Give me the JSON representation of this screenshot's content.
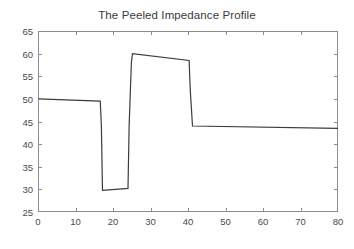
{
  "chart_data": {
    "type": "line",
    "title": "The Peeled Impedance Profile",
    "xlabel": "",
    "ylabel": "",
    "xlim": [
      0,
      80
    ],
    "ylim": [
      25,
      65
    ],
    "xticks": [
      0,
      10,
      20,
      30,
      40,
      50,
      60,
      70,
      80
    ],
    "yticks": [
      25,
      30,
      35,
      40,
      45,
      50,
      55,
      60,
      65
    ],
    "grid": false,
    "legend": null,
    "line_color": "#3c3c3c",
    "line_width": 1.2,
    "series": [
      {
        "name": "impedance",
        "x": [
          0,
          16.6,
          16.9,
          17.2,
          24.0,
          24.3,
          24.9,
          25.2,
          40.3,
          40.6,
          41.2,
          80
        ],
        "y": [
          50.0,
          49.5,
          44.0,
          29.8,
          30.2,
          44.0,
          58.0,
          60.0,
          58.5,
          52.0,
          44.0,
          43.5
        ]
      }
    ],
    "segments": [
      {
        "label": "first-plateau",
        "x_start": 0,
        "x_end": 16.6,
        "y_start": 50.0,
        "y_end": 49.5
      },
      {
        "label": "trough",
        "x_start": 17.2,
        "x_end": 24.0,
        "y_start": 29.8,
        "y_end": 30.2
      },
      {
        "label": "peak-plateau",
        "x_start": 25.2,
        "x_end": 40.3,
        "y_start": 60.0,
        "y_end": 58.5
      },
      {
        "label": "final-plateau",
        "x_start": 41.2,
        "x_end": 80,
        "y_start": 44.0,
        "y_end": 43.5
      }
    ]
  },
  "axes": {
    "x_tick_labels": [
      "0",
      "10",
      "20",
      "30",
      "40",
      "50",
      "60",
      "70",
      "80"
    ],
    "y_tick_labels": [
      "25",
      "30",
      "35",
      "40",
      "45",
      "50",
      "55",
      "60",
      "65"
    ]
  }
}
